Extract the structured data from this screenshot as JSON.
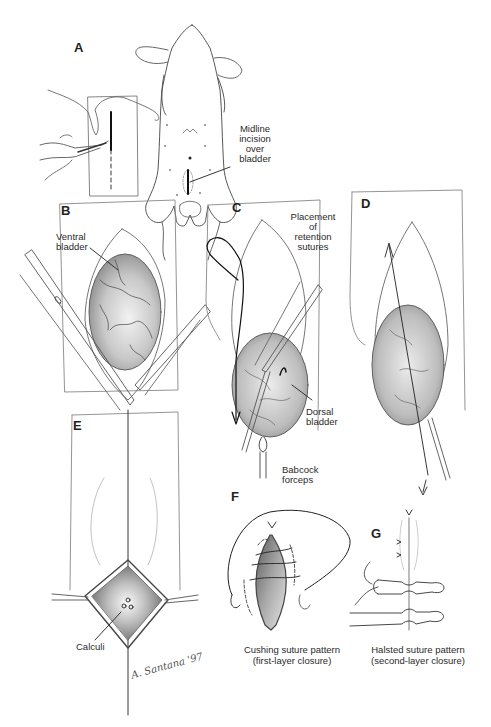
{
  "figure": {
    "panels": {
      "A": {
        "letter": "A",
        "label_lines": [
          "Midline",
          "incision",
          "over",
          "bladder"
        ]
      },
      "B": {
        "letter": "B",
        "label_lines": [
          "Ventral",
          "bladder"
        ]
      },
      "C": {
        "letter": "C",
        "labels": {
          "top": [
            "Placement",
            "of",
            "retention",
            "sutures"
          ],
          "middle": [
            "Dorsal",
            "bladder"
          ],
          "bottom": [
            "Babcock",
            "forceps"
          ]
        }
      },
      "D": {
        "letter": "D"
      },
      "E": {
        "letter": "E",
        "label_lines": [
          "Calculi"
        ]
      },
      "F": {
        "letter": "F",
        "caption": [
          "Cushing suture pattern",
          "(first-layer closure)"
        ]
      },
      "G": {
        "letter": "G",
        "caption": [
          "Halsted suture pattern",
          "(second-layer closure)"
        ]
      }
    },
    "signature": "A. Santana '97"
  }
}
